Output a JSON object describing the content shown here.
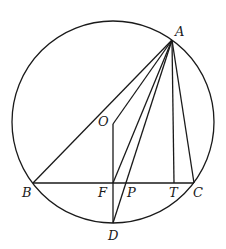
{
  "diagram": {
    "type": "geometry",
    "circle": {
      "cx": 113,
      "cy": 122,
      "r": 101
    },
    "points": {
      "A": {
        "label": "A",
        "x": 172,
        "y": 40
      },
      "O": {
        "label": "O",
        "x": 113,
        "y": 124
      },
      "B": {
        "label": "B",
        "x": 33,
        "y": 183
      },
      "F": {
        "label": "F",
        "x": 113,
        "y": 183
      },
      "P": {
        "label": "P",
        "x": 127,
        "y": 183
      },
      "T": {
        "label": "T",
        "x": 174,
        "y": 183
      },
      "C": {
        "label": "C",
        "x": 194,
        "y": 183
      },
      "D": {
        "label": "D",
        "x": 113,
        "y": 223
      }
    },
    "segments": [
      [
        "A",
        "B"
      ],
      [
        "A",
        "O"
      ],
      [
        "A",
        "F"
      ],
      [
        "A",
        "D"
      ],
      [
        "A",
        "T"
      ],
      [
        "A",
        "C"
      ],
      [
        "B",
        "C"
      ],
      [
        "O",
        "D"
      ]
    ],
    "labels": {
      "A": "A",
      "O": "O",
      "B": "B",
      "F": "F",
      "P": "P",
      "T": "T",
      "C": "C",
      "D": "D"
    }
  }
}
